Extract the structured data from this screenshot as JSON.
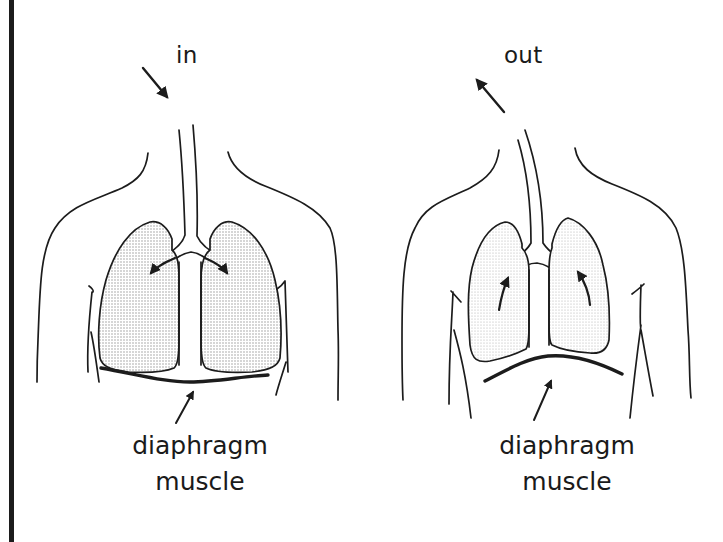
{
  "figure": {
    "panels": [
      {
        "id": "inhale",
        "direction_label": "in",
        "airflow_arrow": "arrow-down-right-icon",
        "bronchi_arrows": "arrows-outward-into-lungs",
        "diaphragm_shape": "flat (contracted)",
        "diaphragm_label_line1": "diaphragm",
        "diaphragm_label_line2": "muscle"
      },
      {
        "id": "exhale",
        "direction_label": "out",
        "airflow_arrow": "arrow-up-left-icon",
        "bronchi_arrows": "arrows-upward-out-of-lungs",
        "diaphragm_shape": "domed (relaxed)",
        "diaphragm_label_line1": "diaphragm",
        "diaphragm_label_line2": "muscle"
      }
    ],
    "colors": {
      "line": "#1c1c1c",
      "lung_fill": "#d9d9d9",
      "background": "#ffffff"
    }
  }
}
